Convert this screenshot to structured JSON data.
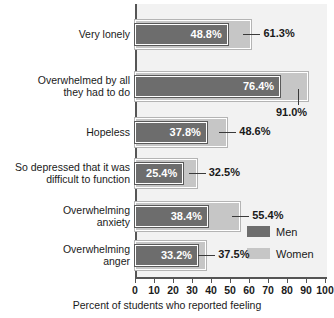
{
  "chart_data": {
    "type": "bar",
    "orientation": "horizontal",
    "title": "",
    "xlabel": "Percent of students who reported feeling",
    "ylabel": "",
    "xlim": [
      0,
      100
    ],
    "xticks": [
      "0",
      "10",
      "20",
      "30",
      "40",
      "50",
      "60",
      "70",
      "80",
      "90",
      "100"
    ],
    "grid": false,
    "legend_position": "bottom-right",
    "categories": [
      "Very lonely",
      "Overwhelmed by all\nthey had to do",
      "Hopeless",
      "So depressed that it was\ndifficult to function",
      "Overwhelming\nanxiety",
      "Overwhelming\nanger"
    ],
    "series": [
      {
        "name": "Men",
        "color": "#6d6d6d",
        "values": [
          48.8,
          76.4,
          37.8,
          25.4,
          38.4,
          33.2
        ],
        "labels": [
          "48.8%",
          "76.4%",
          "37.8%",
          "25.4%",
          "38.4%",
          "33.2%"
        ]
      },
      {
        "name": "Women",
        "color": "#c6c6c6",
        "values": [
          61.3,
          91.0,
          48.6,
          32.5,
          55.4,
          37.5
        ],
        "labels": [
          "61.3%",
          "91.0%",
          "48.6%",
          "32.5%",
          "55.4%",
          "37.5%"
        ]
      }
    ]
  },
  "legend": {
    "items": [
      {
        "label": "Men",
        "color": "#6d6d6d"
      },
      {
        "label": "Women",
        "color": "#c6c6c6"
      }
    ]
  },
  "axis": {
    "x_title": "Percent of students who reported feeling"
  }
}
